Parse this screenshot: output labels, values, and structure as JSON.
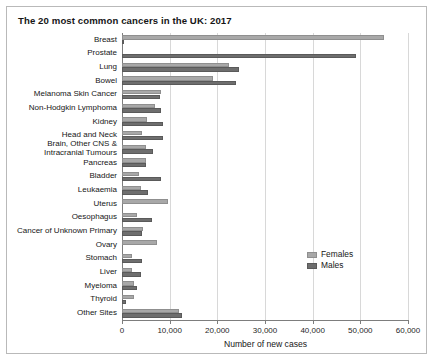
{
  "chart_data": {
    "type": "bar",
    "orientation": "horizontal",
    "title": "The 20 most common cancers in the UK: 2017",
    "xlabel": "Number of new cases",
    "ylabel": "",
    "xlim": [
      0,
      60000
    ],
    "xticks": [
      0,
      10000,
      20000,
      30000,
      40000,
      50000,
      60000
    ],
    "xtick_labels": [
      "0",
      "10,000",
      "20,000",
      "30,000",
      "40,000",
      "50,000",
      "60,000"
    ],
    "grid": true,
    "legend_position": "inside-right",
    "categories": [
      "Breast",
      "Prostate",
      "Lung",
      "Bowel",
      "Melanoma Skin Cancer",
      "Non-Hodgkin Lymphoma",
      "Kidney",
      "Head and Neck",
      "Brain, Other CNS & Intracranial Tumours",
      "Pancreas",
      "Bladder",
      "Leukaemia",
      "Uterus",
      "Oesophagus",
      "Cancer of Unknown Primary",
      "Ovary",
      "Stomach",
      "Liver",
      "Myeloma",
      "Thyroid",
      "Other Sites"
    ],
    "series": [
      {
        "name": "Females",
        "color": "#a8a8a8",
        "values": [
          55000,
          0,
          22500,
          19000,
          8200,
          7000,
          5200,
          4300,
          5000,
          5000,
          3500,
          4000,
          9700,
          3100,
          4400,
          7400,
          2200,
          2000,
          2500,
          2600,
          12000
        ]
      },
      {
        "name": "Males",
        "color": "#6e6e6e",
        "values": [
          400,
          49000,
          24500,
          24000,
          8000,
          8200,
          8500,
          8600,
          6400,
          5000,
          8200,
          5400,
          0,
          6200,
          4300,
          0,
          4200,
          4000,
          3200,
          900,
          12500
        ]
      }
    ]
  },
  "legend": {
    "items": [
      {
        "label": "Females",
        "color": "#a8a8a8"
      },
      {
        "label": "Males",
        "color": "#6e6e6e"
      }
    ]
  }
}
